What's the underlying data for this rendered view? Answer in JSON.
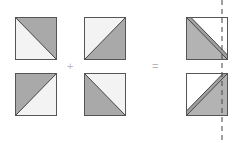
{
  "diagram": {
    "operators": {
      "plus": "+",
      "equals": "="
    },
    "colors": {
      "dark": "#a9a9a9",
      "light": "#f3f3f3",
      "stroke": "#555555",
      "dash": "#444444",
      "operator": "#b8b8b8"
    },
    "squares": [
      {
        "id": "a-top",
        "diagonal": "tl-br",
        "dark_side": "upper-right"
      },
      {
        "id": "a-bottom",
        "diagonal": "bl-tr",
        "dark_side": "upper-left"
      },
      {
        "id": "b-top",
        "diagonal": "bl-tr",
        "dark_side": "lower-right"
      },
      {
        "id": "b-bottom",
        "diagonal": "tl-br",
        "dark_side": "lower-left"
      },
      {
        "id": "result-top",
        "diagonal": "tl-br double",
        "dark_side": "lower-left"
      },
      {
        "id": "result-bottom",
        "diagonal": "bl-tr double",
        "dark_side": "lower-right"
      }
    ],
    "cut_line": "dashed vertical"
  }
}
